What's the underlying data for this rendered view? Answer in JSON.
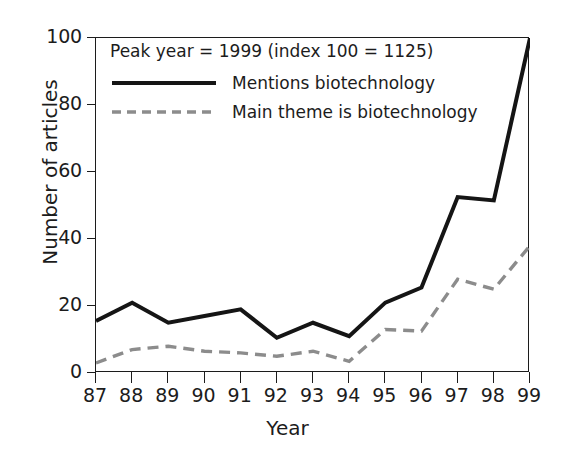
{
  "chart_data": {
    "type": "line",
    "title": "",
    "xlabel": "Year",
    "ylabel": "Number of articles",
    "annotation": "Peak year = 1999 (index 100 = 1125)",
    "categories": [
      "87",
      "88",
      "89",
      "90",
      "91",
      "92",
      "93",
      "94",
      "95",
      "96",
      "97",
      "98",
      "99"
    ],
    "x": [
      87,
      88,
      89,
      90,
      91,
      92,
      93,
      94,
      95,
      96,
      97,
      98,
      99
    ],
    "xlim": [
      87,
      99
    ],
    "ylim": [
      0,
      100
    ],
    "yticks": [
      0,
      20,
      40,
      60,
      80,
      100
    ],
    "xticks": [
      "87",
      "88",
      "89",
      "90",
      "91",
      "92",
      "93",
      "94",
      "95",
      "96",
      "97",
      "98",
      "99"
    ],
    "grid": false,
    "legend_position": "top-left",
    "series": [
      {
        "name": "Mentions biotechnology",
        "style": "solid",
        "color": "#151515",
        "values": [
          15.5,
          21,
          15,
          17,
          19,
          10.5,
          15,
          11,
          21,
          25.5,
          52.5,
          51.5,
          100
        ]
      },
      {
        "name": "Main theme is biotechnology",
        "style": "dashed",
        "color": "#8c8c8c",
        "values": [
          3,
          7,
          8,
          6.5,
          6,
          5,
          6.5,
          3.5,
          13,
          12.5,
          28,
          25,
          38
        ]
      }
    ]
  },
  "legend": {
    "note": "Peak year = 1999 (index 100 = 1125)",
    "entries": [
      {
        "label": "Mentions biotechnology"
      },
      {
        "label": "Main theme is biotechnology"
      }
    ]
  },
  "axes": {
    "y_title": "Number of articles",
    "x_title": "Year"
  },
  "colors": {
    "axis": "#1c1c1c",
    "solid_series": "#151515",
    "dashed_series": "#8c8c8c",
    "background": "#ffffff"
  }
}
